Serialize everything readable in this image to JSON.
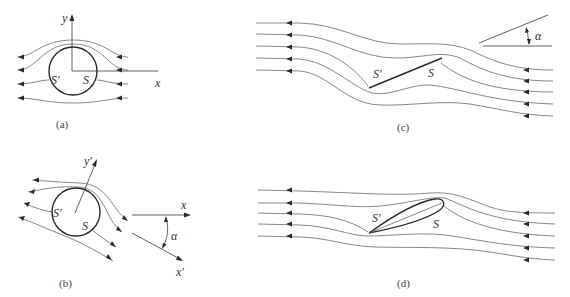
{
  "figure": {
    "panels": [
      {
        "id": "a",
        "caption": "(a)",
        "description": "Flow around a circular cylinder, symmetric streamlines",
        "labels": {
          "y_axis": "y",
          "x_axis": "x",
          "stagnation_rear": "S′",
          "stagnation_front": "S"
        }
      },
      {
        "id": "b",
        "caption": "(b)",
        "description": "Flow around a circular cylinder at angle of attack",
        "labels": {
          "y_axis": "y′",
          "x_axis": "x",
          "x_axis_rotated": "x′",
          "angle": "α",
          "stagnation_rear": "S′",
          "stagnation_front": "S"
        }
      },
      {
        "id": "c",
        "caption": "(c)",
        "description": "Flow past a flat plate at angle of attack",
        "labels": {
          "angle": "α",
          "stagnation_rear": "S′",
          "stagnation_front": "S"
        }
      },
      {
        "id": "d",
        "caption": "(d)",
        "description": "Flow past an airfoil at angle of attack",
        "labels": {
          "stagnation_rear": "S′",
          "stagnation_front": "S"
        }
      }
    ],
    "colors": {
      "stroke": "#2a2a2a",
      "streamline": "#6a6a6a",
      "background": "#ffffff"
    }
  }
}
